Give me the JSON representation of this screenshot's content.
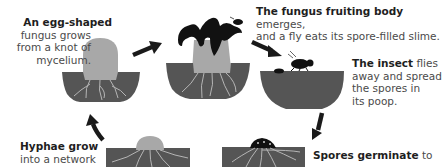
{
  "diagram": {
    "type": "life-cycle",
    "colors": {
      "soil": "#555555",
      "fungus": "#a8a8a8",
      "fruiting_cap": "#111111",
      "roots": "#b5b5b5",
      "arrow": "#1a1a1a",
      "text": "#4a4a4a",
      "text_bold": "#1e1e1e"
    },
    "stages": [
      {
        "id": "egg",
        "bold": "An egg-shaped",
        "lines": [
          "fungus grows",
          "from a knot of",
          "mycelium."
        ]
      },
      {
        "id": "fruiting-body",
        "bold": "The fungus fruiting body",
        "rest_line1": " emerges,",
        "line2": "and a fly eats its spore-filled slime."
      },
      {
        "id": "insect",
        "bold": "The insect",
        "rest_line1": " flies",
        "lines": [
          "away and spread",
          "the spores in",
          "its poop."
        ]
      },
      {
        "id": "spores",
        "bold": "Spores germinate",
        "rest_line1": " to"
      },
      {
        "id": "hyphae",
        "bold": "Hyphae grow",
        "lines": [
          "into a network"
        ]
      }
    ],
    "arrows": [
      "egg-to-fruiting",
      "fruiting-to-insect",
      "insect-to-spores",
      "hyphae-to-egg"
    ]
  }
}
